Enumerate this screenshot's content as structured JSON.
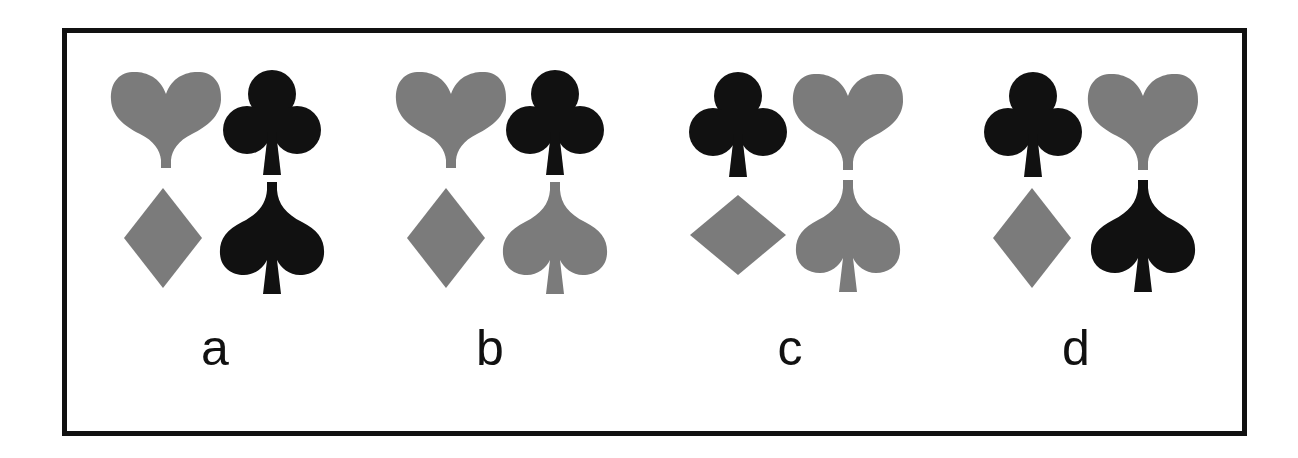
{
  "figure": {
    "colors": {
      "gray": "#7b7b7b",
      "black": "#111111",
      "frame": "#111111",
      "background": "#ffffff"
    },
    "options": [
      {
        "label": "a",
        "grid": [
          [
            {
              "suit": "heart",
              "color": "gray"
            },
            {
              "suit": "club",
              "color": "black"
            }
          ],
          [
            {
              "suit": "diamond",
              "color": "gray",
              "orientation": "tall"
            },
            {
              "suit": "spade",
              "color": "black"
            }
          ]
        ]
      },
      {
        "label": "b",
        "grid": [
          [
            {
              "suit": "heart",
              "color": "gray"
            },
            {
              "suit": "club",
              "color": "black"
            }
          ],
          [
            {
              "suit": "diamond",
              "color": "gray",
              "orientation": "tall"
            },
            {
              "suit": "spade",
              "color": "gray"
            }
          ]
        ]
      },
      {
        "label": "c",
        "grid": [
          [
            {
              "suit": "club",
              "color": "black"
            },
            {
              "suit": "heart",
              "color": "gray"
            }
          ],
          [
            {
              "suit": "diamond",
              "color": "gray",
              "orientation": "wide"
            },
            {
              "suit": "spade",
              "color": "gray"
            }
          ]
        ]
      },
      {
        "label": "d",
        "grid": [
          [
            {
              "suit": "club",
              "color": "black"
            },
            {
              "suit": "heart",
              "color": "gray"
            }
          ],
          [
            {
              "suit": "diamond",
              "color": "gray",
              "orientation": "tall"
            },
            {
              "suit": "spade",
              "color": "black"
            }
          ]
        ]
      }
    ]
  }
}
